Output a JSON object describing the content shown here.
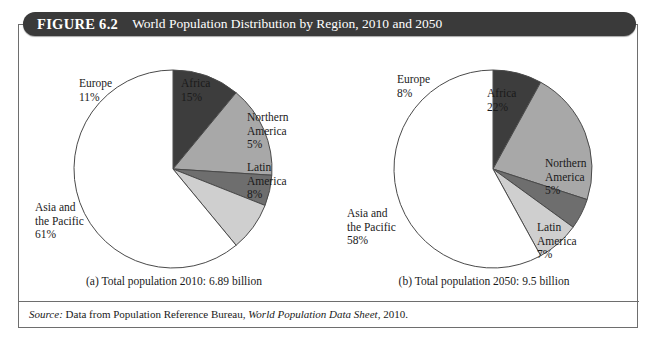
{
  "figure": {
    "number": "FIGURE 6.2",
    "title": "World Population Distribution by Region, 2010 and 2050"
  },
  "source": {
    "prefix": "Source:",
    "text_before": "Data from Population Reference Bureau,",
    "italic_title": "World Population Data Sheet",
    "text_after": ", 2010."
  },
  "panels": [
    {
      "id": "panel-a",
      "caption": "(a) Total population 2010: 6.89 billion",
      "labels": {
        "europe": {
          "name": "Europe",
          "pct": "11%"
        },
        "africa": {
          "name": "Africa",
          "pct": "15%"
        },
        "northern_america": {
          "name": "Northern",
          "name2": "America",
          "pct": "5%"
        },
        "latin_america": {
          "name": "Latin",
          "name2": "America",
          "pct": "8%"
        },
        "asia_pacific": {
          "name": "Asia and",
          "name2": "the Pacific",
          "pct": "61%"
        }
      }
    },
    {
      "id": "panel-b",
      "caption": "(b) Total population 2050: 9.5 billion",
      "labels": {
        "europe": {
          "name": "Europe",
          "pct": "8%"
        },
        "africa": {
          "name": "Africa",
          "pct": "22%"
        },
        "northern_america": {
          "name": "Northern",
          "name2": "America",
          "pct": "5%"
        },
        "latin_america": {
          "name": "Latin",
          "name2": "America",
          "pct": "7%"
        },
        "asia_pacific": {
          "name": "Asia and",
          "name2": "the Pacific",
          "pct": "58%"
        }
      }
    }
  ],
  "colors": {
    "europe": "#3d3d3d",
    "africa": "#a8a8a8",
    "northern_america": "#6e6e6e",
    "latin_america": "#cfcfcf",
    "asia_pacific": "#ffffff",
    "slice_stroke": "#4a4a4a",
    "title_bar": "#3a3a3a",
    "frame": "#6e6e6e"
  },
  "chart_data": [
    {
      "type": "pie",
      "title": "Total population 2010: 6.89 billion",
      "subtitle": "(a)",
      "total_population": "6.89 billion",
      "year": 2010,
      "categories": [
        "Asia and the Pacific",
        "Africa",
        "Europe",
        "Latin America",
        "Northern America"
      ],
      "values": [
        61,
        15,
        11,
        8,
        5
      ],
      "unit": "percent",
      "labels": [
        "61%",
        "15%",
        "11%",
        "8%",
        "5%"
      ],
      "colors": [
        "#ffffff",
        "#a8a8a8",
        "#3d3d3d",
        "#cfcfcf",
        "#6e6e6e"
      ],
      "legend": "none",
      "grid": false,
      "start_angle_deg": -90,
      "direction": "clockwise"
    },
    {
      "type": "pie",
      "title": "Total population 2050: 9.5 billion",
      "subtitle": "(b)",
      "total_population": "9.5 billion",
      "year": 2050,
      "categories": [
        "Asia and the Pacific",
        "Africa",
        "Europe",
        "Latin America",
        "Northern America"
      ],
      "values": [
        58,
        22,
        8,
        7,
        5
      ],
      "unit": "percent",
      "labels": [
        "58%",
        "22%",
        "8%",
        "7%",
        "5%"
      ],
      "colors": [
        "#ffffff",
        "#a8a8a8",
        "#3d3d3d",
        "#cfcfcf",
        "#6e6e6e"
      ],
      "legend": "none",
      "grid": false,
      "start_angle_deg": -90,
      "direction": "clockwise"
    }
  ]
}
